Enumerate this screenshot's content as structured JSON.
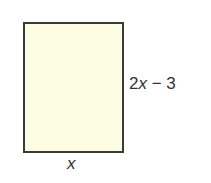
{
  "diagram": {
    "shape": "rectangle",
    "fill_color": "#fdfde4",
    "stroke_color": "#3a3a3a",
    "height_label": "2x − 3",
    "height_label_parts": {
      "coef": "2",
      "var": "x",
      "rest": " − 3"
    },
    "width_label": "x"
  }
}
